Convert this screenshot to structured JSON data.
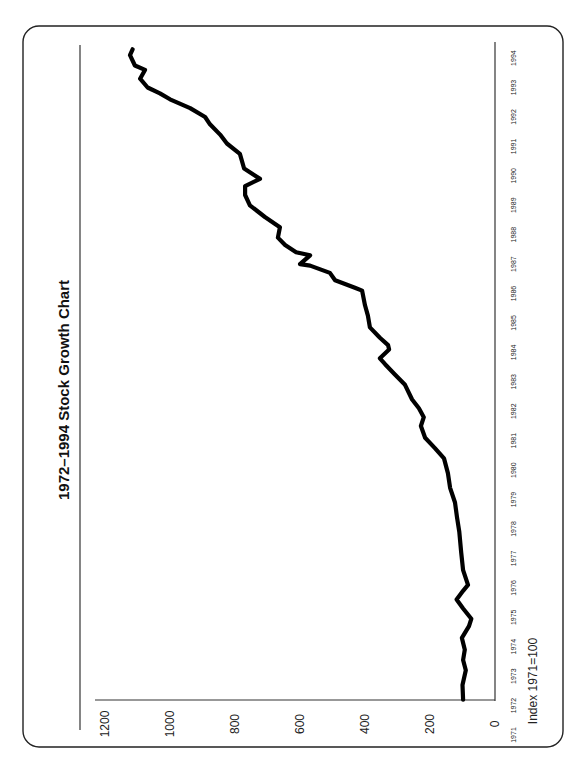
{
  "chart_data": {
    "type": "line",
    "title": "1972–1994 Stock Growth Chart",
    "xlabel": "",
    "ylabel": "Index 1971=100",
    "orientation": "rotated 90° counter-clockwise",
    "ylim": [
      0,
      1200
    ],
    "yticks": [
      0,
      200,
      400,
      600,
      800,
      1000,
      1200
    ],
    "xticks": [
      "1971",
      "1972",
      "1973",
      "1974",
      "1975",
      "1976",
      "1977",
      "1978",
      "1979",
      "1980",
      "1981",
      "1982",
      "1983",
      "1984",
      "1985",
      "1986",
      "1987",
      "1988",
      "1989",
      "1990",
      "1991",
      "1992",
      "1993",
      "1994"
    ],
    "grid": false,
    "legend": null,
    "series": [
      {
        "name": "Stock index",
        "color": "#000000",
        "points": [
          {
            "x": 1972.2,
            "y": 98
          },
          {
            "x": 1972.7,
            "y": 100
          },
          {
            "x": 1973.2,
            "y": 90
          },
          {
            "x": 1973.55,
            "y": 98
          },
          {
            "x": 1973.9,
            "y": 93
          },
          {
            "x": 1974.3,
            "y": 102
          },
          {
            "x": 1974.7,
            "y": 80
          },
          {
            "x": 1974.95,
            "y": 73
          },
          {
            "x": 1975.3,
            "y": 98
          },
          {
            "x": 1975.6,
            "y": 118
          },
          {
            "x": 1975.9,
            "y": 98
          },
          {
            "x": 1976.1,
            "y": 83
          },
          {
            "x": 1976.6,
            "y": 98
          },
          {
            "x": 1977.2,
            "y": 104
          },
          {
            "x": 1977.9,
            "y": 110
          },
          {
            "x": 1978.4,
            "y": 117
          },
          {
            "x": 1978.9,
            "y": 123
          },
          {
            "x": 1979.4,
            "y": 138
          },
          {
            "x": 1979.9,
            "y": 145
          },
          {
            "x": 1980.4,
            "y": 157
          },
          {
            "x": 1980.75,
            "y": 185
          },
          {
            "x": 1981.1,
            "y": 215
          },
          {
            "x": 1981.5,
            "y": 228
          },
          {
            "x": 1981.8,
            "y": 219
          },
          {
            "x": 1982.1,
            "y": 234
          },
          {
            "x": 1982.4,
            "y": 255
          },
          {
            "x": 1982.9,
            "y": 277
          },
          {
            "x": 1983.25,
            "y": 308
          },
          {
            "x": 1983.6,
            "y": 338
          },
          {
            "x": 1983.8,
            "y": 354
          },
          {
            "x": 1984.1,
            "y": 326
          },
          {
            "x": 1984.25,
            "y": 329
          },
          {
            "x": 1984.5,
            "y": 354
          },
          {
            "x": 1984.85,
            "y": 385
          },
          {
            "x": 1985.25,
            "y": 391
          },
          {
            "x": 1985.6,
            "y": 400
          },
          {
            "x": 1986.1,
            "y": 409
          },
          {
            "x": 1986.2,
            "y": 431
          },
          {
            "x": 1986.45,
            "y": 492
          },
          {
            "x": 1986.7,
            "y": 508
          },
          {
            "x": 1986.95,
            "y": 569
          },
          {
            "x": 1987.0,
            "y": 600
          },
          {
            "x": 1987.3,
            "y": 569
          },
          {
            "x": 1987.4,
            "y": 612
          },
          {
            "x": 1987.65,
            "y": 646
          },
          {
            "x": 1987.9,
            "y": 668
          },
          {
            "x": 1988.25,
            "y": 662
          },
          {
            "x": 1988.6,
            "y": 708
          },
          {
            "x": 1989.0,
            "y": 754
          },
          {
            "x": 1989.35,
            "y": 769
          },
          {
            "x": 1989.65,
            "y": 769
          },
          {
            "x": 1689.9,
            "y": null
          },
          {
            "x": 1989.9,
            "y": 723
          },
          {
            "x": 1990.25,
            "y": 772
          },
          {
            "x": 1990.75,
            "y": 785
          },
          {
            "x": 1991.1,
            "y": 825
          },
          {
            "x": 1991.4,
            "y": 846
          },
          {
            "x": 1991.75,
            "y": 877
          },
          {
            "x": 1992.0,
            "y": 892
          },
          {
            "x": 1992.3,
            "y": 938
          },
          {
            "x": 1992.6,
            "y": 1000
          },
          {
            "x": 1992.8,
            "y": 1031
          },
          {
            "x": 1993.0,
            "y": 1069
          },
          {
            "x": 1993.3,
            "y": 1092
          },
          {
            "x": 1993.6,
            "y": 1077
          },
          {
            "x": 1993.75,
            "y": 1108
          },
          {
            "x": 1994.1,
            "y": 1123
          },
          {
            "x": 1994.3,
            "y": 1115
          }
        ]
      }
    ]
  },
  "labels": {
    "title": "1972–1994 Stock Growth Chart",
    "index_note": "Index 1971=100"
  }
}
